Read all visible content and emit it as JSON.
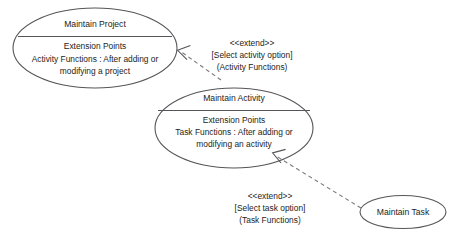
{
  "diagram": {
    "type": "uml-use-case-diagram",
    "background_color": "#ffffff",
    "stroke_color": "#56565a",
    "dash_color": "#7a7a7e",
    "text_color": "#1d1d20",
    "width": 453,
    "height": 239
  },
  "use_cases": [
    {
      "id": "maintain-project",
      "title": "Maintain Project",
      "section_header": "Extension Points",
      "extension_line_1": "Activity Functions : After adding or",
      "extension_line_2": "modifying a project"
    },
    {
      "id": "maintain-activity",
      "title": "Maintain Activity",
      "section_header": "Extension Points",
      "extension_line_1": "Task Functions : After adding or",
      "extension_line_2": "modifying an activity"
    },
    {
      "id": "maintain-task",
      "title": "Maintain Task"
    }
  ],
  "relationships": [
    {
      "id": "extend-activity-to-project",
      "stereotype": "<<extend>>",
      "condition": "[Select activity option]",
      "extension_point": "(Activity Functions)",
      "from": "Maintain Activity",
      "to": "Maintain Project"
    },
    {
      "id": "extend-task-to-activity",
      "stereotype": "<<extend>>",
      "condition": "[Select task option]",
      "extension_point": "(Task Functions)",
      "from": "Maintain Task",
      "to": "Maintain Activity"
    }
  ]
}
